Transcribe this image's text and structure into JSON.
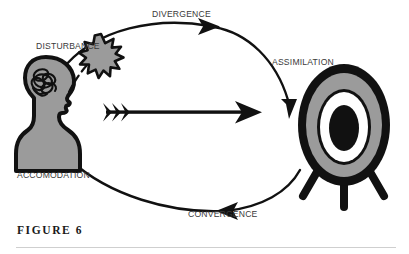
{
  "figure": {
    "caption": "FIGURE 6",
    "labels": {
      "disturbance": "DISTURBANCE",
      "divergence": "DIVERGENCE",
      "assimilation": "ASSIMILATION",
      "convergence": "CONVERGENCE",
      "accomodation": "ACCOMODATION"
    },
    "shapes": {
      "head": "head-silhouette",
      "scribble": "tangled-thought-scribble",
      "starburst": "starburst-burst",
      "dashed_link": "dashed-connector",
      "center_arrow": "straight-arrow-right",
      "target": "bullseye-target-on-stand"
    },
    "colors": {
      "background": "#ffffff",
      "ink": "#111111",
      "fill_gray": "#9b9b9b",
      "label_text": "#3a3a3a",
      "caption_text": "#1a1a1a",
      "rule": "#cfcfcf"
    }
  },
  "diagram_data": {
    "type": "cycle-diagram",
    "title": "FIGURE 6",
    "nodes": [
      {
        "id": "head",
        "label": "",
        "role": "learner-mind",
        "x": 48,
        "y": 112
      },
      {
        "id": "starburst",
        "label": "DISTURBANCE",
        "role": "perturbation",
        "x": 101,
        "y": 50
      },
      {
        "id": "target",
        "label": "",
        "role": "goal-target",
        "x": 344,
        "y": 128
      }
    ],
    "edges": [
      {
        "id": "top-arc",
        "label": "DIVERGENCE",
        "from": "head",
        "to": "target",
        "path": "upper",
        "arrow": true
      },
      {
        "id": "upper-right-arc",
        "label": "ASSIMILATION",
        "from": "top-arc",
        "to": "target",
        "path": "descending",
        "arrow": true
      },
      {
        "id": "bottom-arc",
        "label": "CONVERGENCE",
        "from": "target",
        "to": "head",
        "path": "lower",
        "arrow": true
      },
      {
        "id": "lower-left-arc",
        "label": "ACCOMODATION",
        "from": "bottom-arc",
        "to": "head",
        "path": "ascending",
        "arrow": false
      },
      {
        "id": "center-arrow",
        "label": "",
        "from": "head",
        "to": "target",
        "path": "straight",
        "arrow": true
      },
      {
        "id": "head-to-burst",
        "label": "",
        "from": "head",
        "to": "starburst",
        "path": "dashed",
        "arrow": false
      }
    ]
  }
}
